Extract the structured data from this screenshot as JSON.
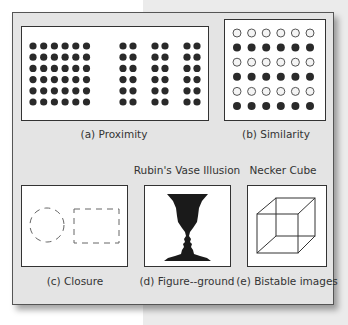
{
  "figure": {
    "panels": [
      {
        "id": "a",
        "caption": "(a) Proximity",
        "principle": "Proximity"
      },
      {
        "id": "b",
        "caption": "(b) Similarity",
        "principle": "Similarity"
      },
      {
        "id": "c",
        "caption": "(c) Closure",
        "principle": "Closure"
      },
      {
        "id": "d",
        "caption": "(d) Figure--ground",
        "title": "Rubin's Vase Illusion",
        "principle": "Figure-ground"
      },
      {
        "id": "e",
        "caption": "(e) Bistable images",
        "title": "Necker Cube",
        "principle": "Bistable images"
      }
    ],
    "proximity": {
      "left_grid": {
        "rows": 6,
        "cols": 6
      },
      "right_groups": {
        "pairs": 3,
        "rows": 6
      }
    },
    "similarity": {
      "rows": 6,
      "cols": 6,
      "row_pattern": [
        "hollow",
        "filled",
        "hollow",
        "filled",
        "hollow",
        "filled"
      ]
    },
    "closure": {
      "shapes": [
        "dashed-circle",
        "dashed-square"
      ]
    },
    "colors": {
      "dot_fill": "#2a2a2a",
      "hollow_stroke": "#555555",
      "panel_bg": "#e4e4e4",
      "box_bg": "#ffffff",
      "silhouette": "#1a1a1a"
    }
  }
}
